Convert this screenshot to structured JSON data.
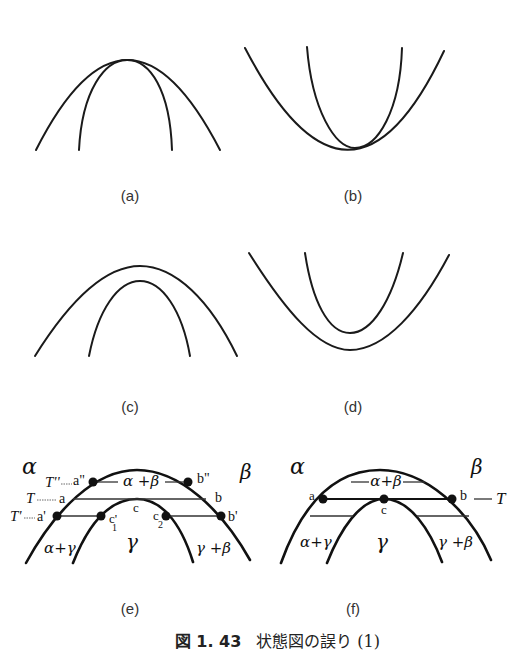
{
  "figure": {
    "caption_number": "図 1. 43",
    "caption_text": "状態図の誤り (1)",
    "panels": [
      {
        "id": "a",
        "label": "(a)",
        "description": "two concave-down curves touching at a common apex"
      },
      {
        "id": "b",
        "label": "(b)",
        "description": "two concave-up curves touching at a common minimum"
      },
      {
        "id": "c",
        "label": "(c)",
        "description": "two nested concave-down curves, not touching"
      },
      {
        "id": "d",
        "label": "(d)",
        "description": "two nested concave-up curves, not touching"
      },
      {
        "id": "e",
        "label": "(e)"
      },
      {
        "id": "f",
        "label": "(f)"
      }
    ]
  },
  "panel_e": {
    "phase_alpha": "α",
    "phase_beta": "β",
    "phase_gamma": "γ",
    "region_alpha_beta": "α +β",
    "region_alpha_gamma": "α+γ",
    "region_gamma_beta": "γ +β",
    "temp_T2": "T''",
    "temp_T": "T",
    "temp_T1": "T'",
    "point_a2": "a\"",
    "point_b2": "b\"",
    "point_a": "a",
    "point_b": "b",
    "point_a1": "a'",
    "point_b1": "b'",
    "point_c": "c",
    "point_c1": "c'",
    "point_c1_sub": "1",
    "point_c2": "c",
    "point_c2_sub": "2"
  },
  "panel_f": {
    "phase_alpha": "α",
    "phase_beta": "β",
    "phase_gamma": "γ",
    "region_alpha_beta": "α+β",
    "region_alpha_gamma": "α+γ",
    "region_gamma_beta": "γ +β",
    "temp_T": "T",
    "point_a": "a",
    "point_b": "b",
    "point_c": "c"
  }
}
